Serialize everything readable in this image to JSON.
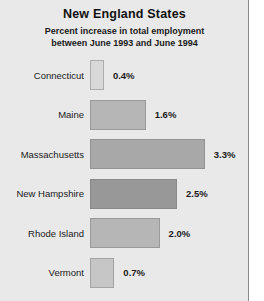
{
  "chart_data": {
    "type": "bar",
    "orientation": "horizontal",
    "title": "New England States",
    "subtitle_line1": "Percent increase in total employment",
    "subtitle_line2": "between June 1993 and June 1994",
    "xlabel": "",
    "ylabel": "",
    "unit": "%",
    "xlim": [
      0,
      3.3
    ],
    "grid": false,
    "legend": "none",
    "categories": [
      "Connecticut",
      "Maine",
      "Massachusetts",
      "New Hampshire",
      "Rhode Island",
      "Vermont"
    ],
    "values": [
      0.4,
      1.6,
      3.3,
      2.5,
      2.0,
      0.7
    ],
    "value_labels": [
      "0.4%",
      "1.6%",
      "3.3%",
      "2.5%",
      "2.0%",
      "0.7%"
    ],
    "bars": [
      {
        "category": "Connecticut",
        "value": 0.4,
        "label": "0.4%",
        "color": "#d8d8d8"
      },
      {
        "category": "Maine",
        "value": 1.6,
        "label": "1.6%",
        "color": "#b6b6b6"
      },
      {
        "category": "Massachusetts",
        "value": 3.3,
        "label": "3.3%",
        "color": "#a8a8a8"
      },
      {
        "category": "New Hampshire",
        "value": 2.5,
        "label": "2.5%",
        "color": "#989898"
      },
      {
        "category": "Rhode Island",
        "value": 2.0,
        "label": "2.0%",
        "color": "#b6b6b6"
      },
      {
        "category": "Vermont",
        "value": 0.7,
        "label": "0.7%",
        "color": "#c6c6c6"
      }
    ],
    "colors": {
      "background": "#e9e9e9",
      "frame_border": "#8a8a8a",
      "text": "#1a1a1a"
    }
  }
}
